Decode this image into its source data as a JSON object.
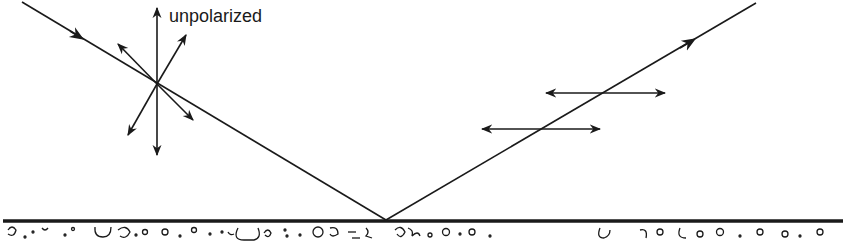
{
  "diagram": {
    "labels": {
      "incident_polarization": "unpolarized"
    },
    "colors": {
      "ink": "#1a1a1a",
      "background": "#ffffff"
    },
    "elements": {
      "incident_ray": "incident ray (unpolarized light)",
      "reflected_ray": "reflected ray (horizontally polarized)",
      "surface": "reflecting surface"
    }
  }
}
